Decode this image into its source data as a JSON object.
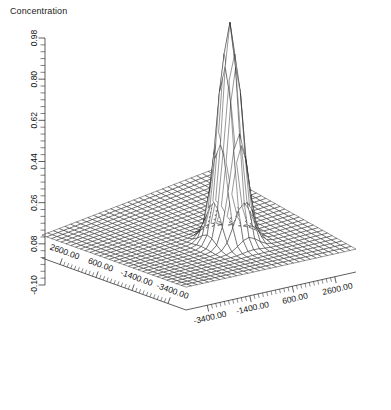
{
  "title": "Concentration",
  "chart_data": {
    "type": "surface",
    "title": "Concentration",
    "zlabel": "Concentration",
    "xlabel": "",
    "ylabel": "",
    "projection": "3d-wireframe",
    "grid": true,
    "legend": "none",
    "z_axis": {
      "ticks": [
        "-0.10",
        "0.08",
        "0.26",
        "0.44",
        "0.62",
        "0.80",
        "0.98"
      ],
      "values": [
        -0.1,
        0.08,
        0.26,
        0.44,
        0.62,
        0.8,
        0.98
      ],
      "zlim": [
        -0.1,
        0.98
      ],
      "minor_ticks_between": 5,
      "orientation": "rotated-90"
    },
    "x_axis": {
      "name": "x",
      "ticks": [
        "-3400.00",
        "-1400.00",
        "600.00",
        "2600.00"
      ],
      "values": [
        -3400,
        -1400,
        600,
        2600
      ],
      "xlim": [
        -4400,
        3600
      ],
      "minor_ticks_between": 9,
      "side": "front-right"
    },
    "y_axis": {
      "name": "y",
      "ticks": [
        "2600.00",
        "600.00",
        "-1400.00",
        "-3400.00"
      ],
      "values": [
        2600,
        600,
        -1400,
        -3400
      ],
      "ylim": [
        3600,
        -4400
      ],
      "minor_ticks_between": 9,
      "side": "front-left"
    },
    "surface": {
      "nx": 30,
      "ny": 30,
      "baseline": 0.0,
      "peaks": [
        {
          "amplitude": 0.96,
          "center_x": 700,
          "center_y": -900,
          "sigma_x": 430,
          "sigma_y": 430
        }
      ],
      "description": "Near-flat baseline at z=0 with one sharp narrow Gaussian spike reaching z=0.96 near x=700, y=-900"
    },
    "style": {
      "line_color": "#1a1a1a",
      "line_width": 0.45,
      "fill_color": "#ffffff",
      "background": "#ffffff"
    }
  }
}
